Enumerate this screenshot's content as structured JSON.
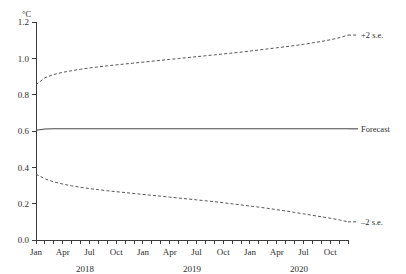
{
  "chart_data": {
    "type": "line",
    "title": "",
    "subtitle": "",
    "xlabel": "",
    "ylabel": "",
    "unit_label": "°C",
    "ylim": [
      0.0,
      1.2
    ],
    "yticks": [
      0.0,
      0.2,
      0.4,
      0.6,
      0.8,
      1.0,
      1.2
    ],
    "ytick_labels": [
      "0.0",
      "0.2",
      "0.4",
      "0.6",
      "0.8",
      "1.0",
      "1.2"
    ],
    "grid": false,
    "legend_position": "right-inline-annotations",
    "x": [
      "2018-01",
      "2018-02",
      "2018-03",
      "2018-04",
      "2018-05",
      "2018-06",
      "2018-07",
      "2018-08",
      "2018-09",
      "2018-10",
      "2018-11",
      "2018-12",
      "2019-01",
      "2019-02",
      "2019-03",
      "2019-04",
      "2019-05",
      "2019-06",
      "2019-07",
      "2019-08",
      "2019-09",
      "2019-10",
      "2019-11",
      "2019-12",
      "2020-01",
      "2020-02",
      "2020-03",
      "2020-04",
      "2020-05",
      "2020-06",
      "2020-07",
      "2020-08",
      "2020-09",
      "2020-10",
      "2020-11",
      "2020-12"
    ],
    "xtick_labels": [
      "Jan",
      "",
      "",
      "Apr",
      "",
      "",
      "Jul",
      "",
      "",
      "Oct",
      "",
      "",
      "Jan",
      "",
      "",
      "Apr",
      "",
      "",
      "Jul",
      "",
      "",
      "Oct",
      "",
      "",
      "Jan",
      "",
      "",
      "Apr",
      "",
      "",
      "Jul",
      "",
      "",
      "Oct",
      "",
      ""
    ],
    "xtick_visible_labels": [
      "Jan",
      "Apr",
      "Jul",
      "Oct",
      "Jan",
      "Apr",
      "Jul",
      "Oct",
      "Jan",
      "Apr",
      "Jul",
      "Oct"
    ],
    "year_groups": [
      {
        "label": "2018",
        "start_index": 0,
        "end_index": 11
      },
      {
        "label": "2019",
        "start_index": 12,
        "end_index": 23
      },
      {
        "label": "2020",
        "start_index": 24,
        "end_index": 35
      }
    ],
    "series": [
      {
        "name": "+2 s.e.",
        "style": "dashed",
        "label": "+2 s.e.",
        "values": [
          0.855,
          0.893,
          0.911,
          0.923,
          0.932,
          0.94,
          0.947,
          0.953,
          0.959,
          0.964,
          0.969,
          0.974,
          0.979,
          0.984,
          0.989,
          0.994,
          0.999,
          1.004,
          1.009,
          1.014,
          1.019,
          1.024,
          1.029,
          1.034,
          1.04,
          1.046,
          1.052,
          1.058,
          1.064,
          1.07,
          1.077,
          1.085,
          1.093,
          1.102,
          1.113,
          1.128
        ]
      },
      {
        "name": "Forecast",
        "style": "solid",
        "label": "Forecast",
        "values": [
          0.604,
          0.611,
          0.612,
          0.612,
          0.612,
          0.612,
          0.612,
          0.612,
          0.612,
          0.612,
          0.612,
          0.612,
          0.612,
          0.612,
          0.612,
          0.612,
          0.612,
          0.612,
          0.612,
          0.612,
          0.612,
          0.612,
          0.612,
          0.612,
          0.612,
          0.612,
          0.612,
          0.612,
          0.612,
          0.612,
          0.612,
          0.612,
          0.612,
          0.612,
          0.612,
          0.612
        ]
      },
      {
        "name": "-2 s.e.",
        "style": "dashed",
        "label": "–2 s.e.",
        "values": [
          0.362,
          0.337,
          0.32,
          0.308,
          0.298,
          0.29,
          0.283,
          0.277,
          0.271,
          0.266,
          0.261,
          0.256,
          0.251,
          0.246,
          0.241,
          0.236,
          0.231,
          0.226,
          0.221,
          0.216,
          0.211,
          0.205,
          0.199,
          0.193,
          0.187,
          0.181,
          0.174,
          0.167,
          0.16,
          0.152,
          0.144,
          0.136,
          0.128,
          0.12,
          0.111,
          0.1
        ]
      }
    ],
    "annotations": [
      {
        "text": "+2 s.e.",
        "series": "+2 s.e.",
        "position": "right"
      },
      {
        "text": "Forecast",
        "series": "Forecast",
        "position": "right"
      },
      {
        "text": "–2 s.e.",
        "series": "-2 s.e.",
        "position": "right"
      }
    ],
    "colors": {
      "axis": "#3a3a3a",
      "forecast_line": "#4a4a4a",
      "band_line": "#555555",
      "background": "#ffffff"
    }
  }
}
